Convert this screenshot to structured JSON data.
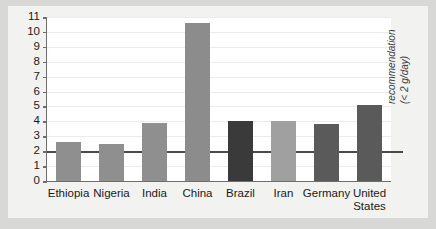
{
  "chart_data": {
    "type": "bar",
    "title": "",
    "subtitle": "",
    "xlabel": "",
    "ylabel": "",
    "categories": [
      "Ethiopia",
      "Nigeria",
      "India",
      "China",
      "Brazil",
      "Iran",
      "Germany",
      "United\nStates"
    ],
    "values": [
      2.6,
      2.5,
      3.9,
      10.6,
      4.0,
      4.0,
      3.8,
      5.1
    ],
    "ylim": [
      0,
      11
    ],
    "yticks": [
      0,
      1,
      2,
      3,
      4,
      5,
      6,
      7,
      8,
      9,
      10,
      11
    ],
    "ytick_labels": [
      "0",
      "1",
      "2",
      "3",
      "4",
      "5",
      "6",
      "7",
      "8",
      "9",
      "10",
      "11"
    ],
    "grid": true,
    "legend": "none",
    "bar_colors": [
      "#8f8f8f",
      "#8f8f8f",
      "#8f8f8f",
      "#8c8c8c",
      "#3a3a3a",
      "#a0a0a0",
      "#5a5a5a",
      "#5a5a5a"
    ],
    "annotations": [
      {
        "name": "recommendation-reference-line",
        "type": "hline",
        "y": 2,
        "color": "#4a4a4a",
        "label_line1": "recommendation",
        "label_line2": "(< 2 g/day)"
      }
    ]
  },
  "figure": {
    "background_color": "#d8d8d6",
    "canvas_color": "#f2f2f0",
    "plot_color": "#ffffff",
    "axis_color": "#6e6e6e",
    "grid_color": "#eceaea",
    "text_color": "#1a1a1a"
  }
}
